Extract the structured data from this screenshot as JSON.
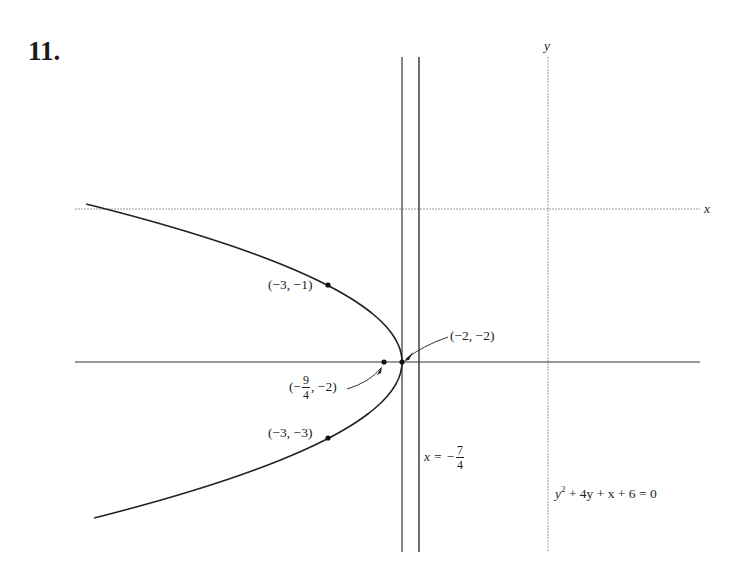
{
  "problem": {
    "number": "11."
  },
  "axes": {
    "x_label": "x",
    "y_label": "y"
  },
  "equation": {
    "lhs_base": "y",
    "lhs_exp": "2",
    "rest": " + 4y + x + 6 = 0"
  },
  "directrix": {
    "prefix": "x = −",
    "num": "7",
    "den": "4"
  },
  "points": {
    "p1": {
      "label": "(−3, −1)"
    },
    "p2": {
      "label": "(−3, −3)"
    },
    "vertex": {
      "label": "(−2, −2)"
    },
    "focus": {
      "prefix": "(−",
      "num": "9",
      "den": "4",
      "suffix": ", −2)"
    }
  },
  "chart_data": {
    "type": "diagram",
    "title": "11.",
    "curve": {
      "kind": "parabola",
      "equation": "y^2 + 4y + x + 6 = 0",
      "opens": "left",
      "vertex": [
        -2,
        -2
      ],
      "focus": [
        -2.25,
        -2
      ]
    },
    "lines": [
      {
        "kind": "directrix",
        "equation": "x = -7/4"
      },
      {
        "kind": "vertical-line",
        "equation": "x = -2"
      },
      {
        "kind": "horizontal-line",
        "equation": "y = -2"
      }
    ],
    "labeled_points": [
      {
        "label": "(-3, -1)",
        "x": -3,
        "y": -1
      },
      {
        "label": "(-3, -3)",
        "x": -3,
        "y": -3
      },
      {
        "label": "(-2, -2)",
        "x": -2,
        "y": -2
      },
      {
        "label": "(-9/4, -2)",
        "x": -2.25,
        "y": -2
      }
    ],
    "axes": {
      "xlabel": "x",
      "ylabel": "y",
      "grid": false
    }
  }
}
